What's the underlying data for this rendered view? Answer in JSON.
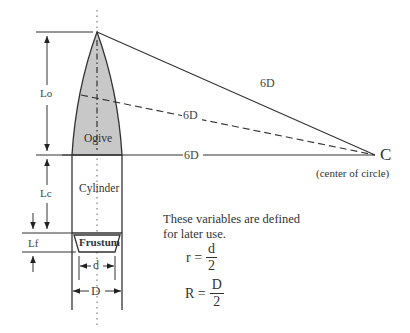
{
  "diagram": {
    "parts": {
      "ogive": "Ogive",
      "cylinder": "Cylinder",
      "frustum": "Frustum"
    },
    "dimensions": {
      "ogive_length": "Lo",
      "cylinder_length": "Lc",
      "frustum_length": "Lf",
      "small_diameter": "d",
      "diameter": "D"
    },
    "radius_lines": [
      {
        "label": "6D",
        "style": "solid"
      },
      {
        "label": "6D",
        "style": "dashed"
      },
      {
        "label": "6D",
        "style": "solid"
      }
    ],
    "center": {
      "label": "C",
      "caption": "(center of circle)"
    },
    "note": {
      "line1": "These variables are defined",
      "line2": "for later use."
    },
    "equations": [
      {
        "lhs": "r =",
        "numerator": "d",
        "denominator": "2"
      },
      {
        "lhs": "R =",
        "numerator": "D",
        "denominator": "2"
      }
    ],
    "colors": {
      "ogive_fill": "#c8c8c8",
      "line": "#333333"
    }
  }
}
